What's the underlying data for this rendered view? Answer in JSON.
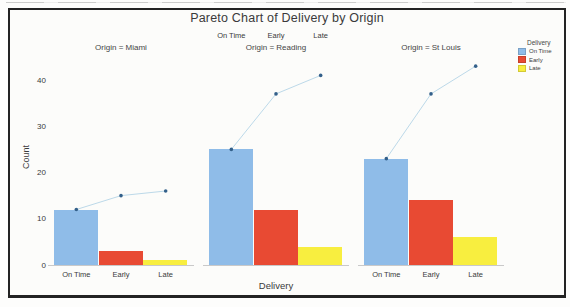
{
  "title": "Pareto Chart of Delivery by Origin",
  "axes": {
    "y_label": "Count",
    "x_label": "Delivery",
    "y_ticks": [
      0,
      10,
      20,
      30,
      40
    ]
  },
  "legend": {
    "title": "Delivery",
    "items": [
      {
        "label": "On Time",
        "color": "#8FBCE8"
      },
      {
        "label": "Early",
        "color": "#E84A33"
      },
      {
        "label": "Late",
        "color": "#F8EE3F"
      }
    ]
  },
  "colors": {
    "cumulative_line": "#BCD9E9",
    "cumulative_dot": "#33608A",
    "baseline": "#C9C9C9"
  },
  "chart_data": {
    "type": "bar",
    "subtype": "pareto-faceted-with-cumulative-line",
    "title": "Pareto Chart of Delivery by Origin",
    "xlabel": "Delivery",
    "ylabel": "Count",
    "ylim": [
      0,
      45
    ],
    "grid": false,
    "legend_position": "right",
    "categories": [
      "On Time",
      "Early",
      "Late"
    ],
    "facets": [
      {
        "title": "Origin = Miami",
        "values": [
          12,
          3,
          1
        ],
        "cumulative": [
          12,
          15,
          16
        ],
        "tick_labels_position": "bottom"
      },
      {
        "title": "Origin = Reading",
        "values": [
          25,
          12,
          4
        ],
        "cumulative": [
          25,
          37,
          41
        ],
        "tick_labels_position": "top"
      },
      {
        "title": "Origin = St Louis",
        "values": [
          23,
          14,
          6
        ],
        "cumulative": [
          23,
          37,
          43
        ],
        "tick_labels_position": "bottom"
      }
    ]
  }
}
